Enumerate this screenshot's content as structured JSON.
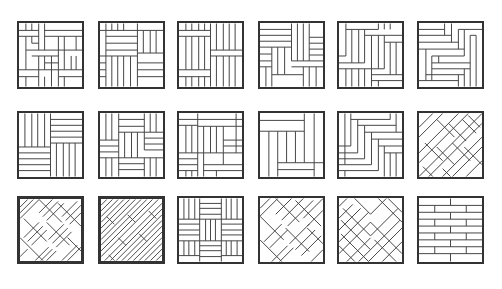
{
  "diagram": {
    "rows": 3,
    "columns": 6,
    "line_color": "#333333",
    "background": "#ffffff",
    "tiles": [
      {
        "id": "r1c1",
        "pattern": "basket-weave-interlaced",
        "x": 17,
        "y": 21
      },
      {
        "id": "r1c2",
        "pattern": "pinwheel-square-planks",
        "x": 98,
        "y": 21
      },
      {
        "id": "r1c3",
        "pattern": "vertical-with-horizontal-bands",
        "x": 177,
        "y": 21
      },
      {
        "id": "r1c4",
        "pattern": "pinwheel-offset",
        "x": 258,
        "y": 21
      },
      {
        "id": "r1c5",
        "pattern": "staggered-herringbone-blocks",
        "x": 337,
        "y": 21
      },
      {
        "id": "r1c6",
        "pattern": "stepped-herringbone",
        "x": 417,
        "y": 21
      },
      {
        "id": "r2c1",
        "pattern": "four-quadrant-basket",
        "x": 17,
        "y": 111
      },
      {
        "id": "r2c2",
        "pattern": "woven-cross",
        "x": 98,
        "y": 111
      },
      {
        "id": "r2c3",
        "pattern": "interlocking-l-blocks",
        "x": 177,
        "y": 111
      },
      {
        "id": "r2c4",
        "pattern": "frame-with-vertical-center",
        "x": 258,
        "y": 111
      },
      {
        "id": "r2c5",
        "pattern": "stepped-herringbone-left",
        "x": 337,
        "y": 111
      },
      {
        "id": "r2c6",
        "pattern": "diagonal-herringbone",
        "x": 417,
        "y": 111
      },
      {
        "id": "r3c1",
        "pattern": "diagonal-basket-weave",
        "x": 17,
        "y": 196
      },
      {
        "id": "r3c2",
        "pattern": "diagonal-staggered-strips",
        "x": 98,
        "y": 196
      },
      {
        "id": "r3c3",
        "pattern": "checkerboard-basket",
        "x": 177,
        "y": 196
      },
      {
        "id": "r3c4",
        "pattern": "diagonal-basket-wide",
        "x": 258,
        "y": 196
      },
      {
        "id": "r3c5",
        "pattern": "chevron-herringbone",
        "x": 337,
        "y": 196
      },
      {
        "id": "r3c6",
        "pattern": "brick-running-bond",
        "x": 417,
        "y": 196
      }
    ]
  }
}
